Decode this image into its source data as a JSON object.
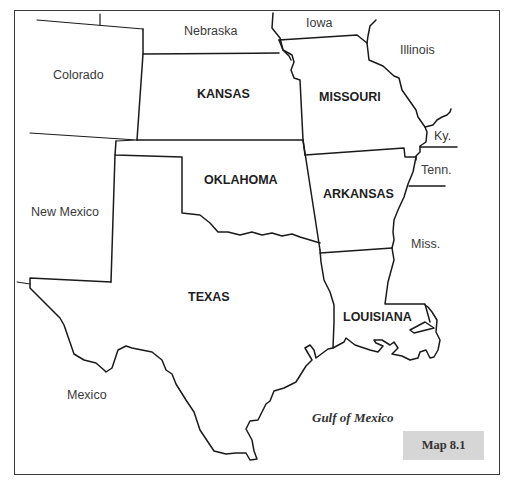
{
  "map": {
    "caption": "Map 8.1",
    "water_body": "Gulf of Mexico",
    "focus_states": [
      {
        "id": "kansas",
        "label": "KANSAS"
      },
      {
        "id": "missouri",
        "label": "MISSOURI"
      },
      {
        "id": "oklahoma",
        "label": "OKLAHOMA"
      },
      {
        "id": "arkansas",
        "label": "ARKANSAS"
      },
      {
        "id": "texas",
        "label": "TEXAS"
      },
      {
        "id": "louisiana",
        "label": "LOUISIANA"
      }
    ],
    "neighbors": [
      {
        "id": "nebraska",
        "label": "Nebraska"
      },
      {
        "id": "iowa",
        "label": "Iowa"
      },
      {
        "id": "illinois",
        "label": "Illinois"
      },
      {
        "id": "colorado",
        "label": "Colorado"
      },
      {
        "id": "kentucky",
        "label": "Ky."
      },
      {
        "id": "tennessee",
        "label": "Tenn."
      },
      {
        "id": "new-mexico",
        "label": "New Mexico"
      },
      {
        "id": "mississippi",
        "label": "Miss."
      },
      {
        "id": "mexico",
        "label": "Mexico"
      }
    ],
    "colors": {
      "background": "#ffffff",
      "border": "#1a1a1a",
      "caption_box": "#d6d6d6"
    }
  }
}
